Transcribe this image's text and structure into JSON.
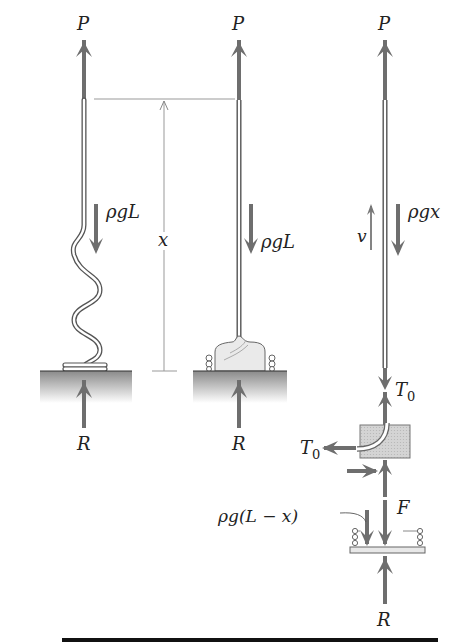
{
  "figure": {
    "panels": [
      {
        "id": "coiled-chain",
        "labels": {
          "top_force": "P",
          "weight": "ρgL",
          "reaction": "R"
        }
      },
      {
        "id": "piled-chain",
        "labels": {
          "top_force": "P",
          "weight": "ρgL",
          "reaction": "R"
        }
      },
      {
        "id": "free-body",
        "labels": {
          "top_force": "P",
          "velocity": "v",
          "weight": "ρgx",
          "tension": "T",
          "tension_sub": "0",
          "tension_left": "T",
          "tension_left_sub": "0",
          "contact_force": "F",
          "pile_weight": "ρg(L − x)",
          "reaction": "R"
        }
      }
    ],
    "dimension": {
      "label": "x"
    },
    "colors": {
      "arrow": "#6e6e6e",
      "chain_outline": "#555555",
      "ground_top": "#8a8a8a",
      "ground_fade": "#ffffff",
      "block_fill": "#cfcfcf",
      "rule": "#111111"
    }
  }
}
